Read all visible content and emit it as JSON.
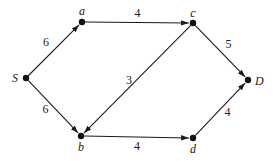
{
  "diagram": {
    "type": "directed-weighted-graph",
    "nodes": [
      {
        "id": "S",
        "label": "S"
      },
      {
        "id": "a",
        "label": "a"
      },
      {
        "id": "b",
        "label": "b"
      },
      {
        "id": "c",
        "label": "c"
      },
      {
        "id": "d",
        "label": "d"
      },
      {
        "id": "D",
        "label": "D"
      }
    ],
    "edges": [
      {
        "from": "S",
        "to": "a",
        "weight": "6"
      },
      {
        "from": "S",
        "to": "b",
        "weight": "6"
      },
      {
        "from": "a",
        "to": "c",
        "weight": "4"
      },
      {
        "from": "c",
        "to": "b",
        "weight": "3"
      },
      {
        "from": "c",
        "to": "D",
        "weight": "5"
      },
      {
        "from": "b",
        "to": "d",
        "weight": "4"
      },
      {
        "from": "d",
        "to": "D",
        "weight": "4"
      }
    ]
  }
}
